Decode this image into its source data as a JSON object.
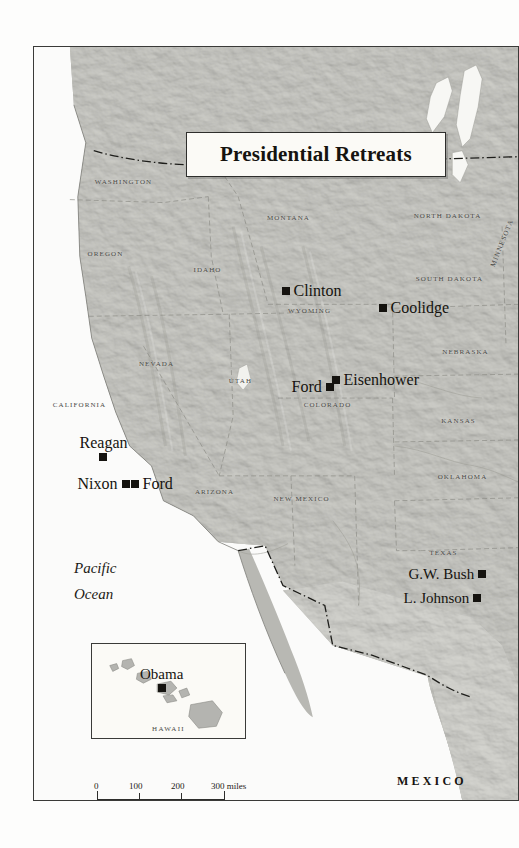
{
  "map": {
    "title": "Presidential Retreats",
    "ocean_label_line1": "Pacific",
    "ocean_label_line2": "Ocean",
    "country_label": "MEXICO",
    "inset": {
      "caption": "HAWAII",
      "retreat": "Obama"
    },
    "scale": {
      "miles": {
        "ticks": [
          "0",
          "100",
          "200",
          "300 miles"
        ],
        "unit": "miles"
      },
      "kilometers": {
        "ticks": [
          "0",
          "200",
          "400 kilometers"
        ],
        "unit": "kilometers"
      }
    },
    "states": [
      {
        "name": "WASHINGTON",
        "x": 124,
        "y": 182
      },
      {
        "name": "OREGON",
        "x": 106,
        "y": 254
      },
      {
        "name": "IDAHO",
        "x": 208,
        "y": 270
      },
      {
        "name": "MONTANA",
        "x": 289,
        "y": 218
      },
      {
        "name": "NEVADA",
        "x": 157,
        "y": 364
      },
      {
        "name": "UTAH",
        "x": 241,
        "y": 381
      },
      {
        "name": "CALIFORNIA",
        "x": 80,
        "y": 405
      },
      {
        "name": "ARIZONA",
        "x": 215,
        "y": 492
      },
      {
        "name": "NEW MEXICO",
        "x": 302,
        "y": 499
      },
      {
        "name": "WYOMING",
        "x": 310,
        "y": 311
      },
      {
        "name": "COLORADO",
        "x": 328,
        "y": 405
      },
      {
        "name": "NORTH DAKOTA",
        "x": 448,
        "y": 216
      },
      {
        "name": "SOUTH DAKOTA",
        "x": 450,
        "y": 279
      },
      {
        "name": "NEBRASKA",
        "x": 466,
        "y": 352
      },
      {
        "name": "KANSAS",
        "x": 459,
        "y": 421
      },
      {
        "name": "OKLAHOMA",
        "x": 463,
        "y": 477
      },
      {
        "name": "TEXAS",
        "x": 444,
        "y": 553
      },
      {
        "name": "MINNESOTA",
        "x": 502,
        "y": 243
      }
    ],
    "retreats": [
      {
        "name": "Clinton",
        "x": 282,
        "y": 282,
        "marker": "left",
        "size": 16
      },
      {
        "name": "Coolidge",
        "x": 379,
        "y": 299,
        "marker": "left",
        "size": 16
      },
      {
        "name": "Eisenhower",
        "x": 332,
        "y": 371,
        "marker": "left",
        "size": 16
      },
      {
        "name": "Ford",
        "x": 292,
        "y": 378,
        "marker": "right",
        "size": 16
      },
      {
        "name": "Reagan",
        "x": 80,
        "y": 434,
        "marker": "below",
        "size": 16
      },
      {
        "name": "Nixon",
        "x": 78,
        "y": 475,
        "marker": "right",
        "size": 16
      },
      {
        "name": "Ford",
        "x": 131,
        "y": 475,
        "marker": "left",
        "size": 16
      },
      {
        "name": "G.W. Bush",
        "x": 409,
        "y": 566,
        "marker": "right",
        "size": 15
      },
      {
        "name": "L. Johnson",
        "x": 404,
        "y": 590,
        "marker": "right",
        "size": 15
      }
    ]
  }
}
